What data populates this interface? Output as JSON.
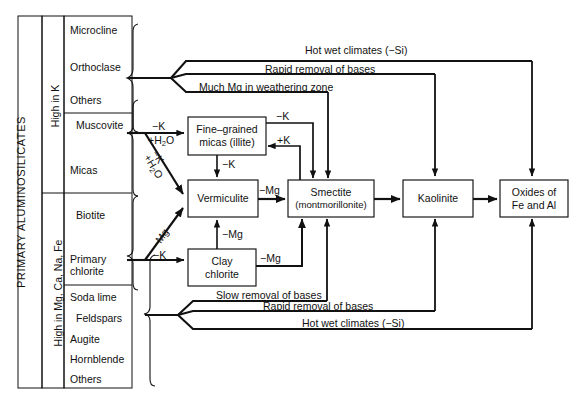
{
  "diagram": {
    "type": "flow-diagram"
  },
  "left_panel": {
    "outer_label": "PRIMARY ALUMINOSILICATES",
    "groups": [
      {
        "id": "high-k",
        "label": "High in K"
      },
      {
        "id": "high-mg",
        "label": "High in Mg, Ca, Na, Fe"
      }
    ],
    "minerals": [
      {
        "id": "microcline",
        "label": "Microcline"
      },
      {
        "id": "orthoclase",
        "label": "Orthoclase"
      },
      {
        "id": "others-k",
        "label": "Others"
      },
      {
        "id": "muscovite",
        "label": "Muscovite"
      },
      {
        "id": "micas",
        "label": "Micas"
      },
      {
        "id": "biotite",
        "label": "Biotite"
      },
      {
        "id": "primary-chlorite",
        "label": "Primary\nchlorite"
      },
      {
        "id": "primary-chlorite-line1",
        "label": "Primary"
      },
      {
        "id": "primary-chlorite-line2",
        "label": "chlorite"
      },
      {
        "id": "soda-lime",
        "label": "Soda lime"
      },
      {
        "id": "feldspars",
        "label": "Feldspars"
      },
      {
        "id": "augite",
        "label": "Augite"
      },
      {
        "id": "hornblende",
        "label": "Hornblende"
      },
      {
        "id": "others-mg",
        "label": "Others"
      }
    ]
  },
  "boxes": [
    {
      "id": "illite",
      "line1": "Fine–grained",
      "line2": "micas (illite)"
    },
    {
      "id": "vermiculite",
      "line1": "Vermiculite",
      "line2": ""
    },
    {
      "id": "clay-chlorite",
      "line1": "Clay",
      "line2": "chlorite"
    },
    {
      "id": "smectite",
      "line1": "Smectite",
      "line2": "(montmorillonite)"
    },
    {
      "id": "kaolinite",
      "line1": "Kaolinite",
      "line2": ""
    },
    {
      "id": "oxides",
      "line1": "Oxides of",
      "line2": "Fe and Al"
    }
  ],
  "arrow_labels": {
    "top_hot_wet": "Hot wet climates (−Si)",
    "top_rapid": "Rapid removal of bases",
    "top_much_mg": "Much Mg in weathering zone",
    "bottom_slow": "Slow removal of bases",
    "bottom_rapid": "Rapid removal of bases",
    "bottom_hot_wet": "Hot wet climates (−Si)",
    "k_to_illite": "−K",
    "h2o_to_illite_pre": "+H",
    "h2o_to_illite_sub": "2",
    "h2o_to_illite_post": "O",
    "k_diag": "−K",
    "h2o_diag_pre": "+H",
    "h2o_diag_sub": "2",
    "h2o_diag_post": "O",
    "mg_diag": "−Mg",
    "k_to_clay": "−K",
    "illite_to_verm": "−K",
    "illite_to_smectite": "−K",
    "smectite_to_illite": "+K",
    "verm_to_smectite": "−Mg",
    "clay_to_verm": "−Mg",
    "clay_to_smectite": "−Mg"
  },
  "colors": {
    "line": "#111111",
    "background": "#ffffff",
    "text": "#111111"
  }
}
